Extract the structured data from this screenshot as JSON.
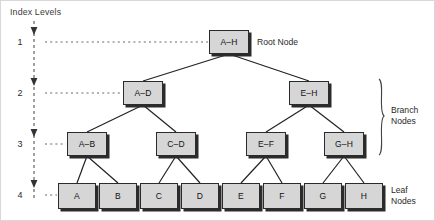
{
  "diagram": {
    "title": "Index Levels",
    "colors": {
      "node_fill": "#d6d6d6",
      "node_border": "#2b2b2b",
      "shadow": "#2b2b2b",
      "guide_line": "#555555",
      "connector": "#222222"
    },
    "levels": [
      {
        "number": "1",
        "y": 41
      },
      {
        "number": "2",
        "y": 92
      },
      {
        "number": "3",
        "y": 143
      },
      {
        "number": "4",
        "y": 194
      }
    ],
    "nodes": {
      "level1": [
        {
          "label": "A–H",
          "x": 208,
          "y": 29,
          "w": 40,
          "h": 24
        }
      ],
      "level2": [
        {
          "label": "A–D",
          "x": 122,
          "y": 80,
          "w": 40,
          "h": 24
        },
        {
          "label": "E–H",
          "x": 288,
          "y": 80,
          "w": 40,
          "h": 24
        }
      ],
      "level3": [
        {
          "label": "A–B",
          "x": 66,
          "y": 131,
          "w": 40,
          "h": 24
        },
        {
          "label": "C–D",
          "x": 155,
          "y": 131,
          "w": 40,
          "h": 24
        },
        {
          "label": "E–F",
          "x": 245,
          "y": 131,
          "w": 40,
          "h": 24
        },
        {
          "label": "G–H",
          "x": 323,
          "y": 131,
          "w": 40,
          "h": 24
        }
      ],
      "level4": [
        {
          "label": "A",
          "x": 57,
          "y": 182,
          "w": 38,
          "h": 26
        },
        {
          "label": "B",
          "x": 98,
          "y": 182,
          "w": 38,
          "h": 26
        },
        {
          "label": "C",
          "x": 139,
          "y": 182,
          "w": 38,
          "h": 26
        },
        {
          "label": "D",
          "x": 180,
          "y": 182,
          "w": 38,
          "h": 26
        },
        {
          "label": "E",
          "x": 221,
          "y": 182,
          "w": 38,
          "h": 26
        },
        {
          "label": "F",
          "x": 262,
          "y": 182,
          "w": 38,
          "h": 26
        },
        {
          "label": "G",
          "x": 303,
          "y": 182,
          "w": 38,
          "h": 26
        },
        {
          "label": "H",
          "x": 344,
          "y": 182,
          "w": 38,
          "h": 26
        }
      ]
    },
    "annotations": {
      "root_node": "Root Node",
      "branch_nodes_line1": "Branch",
      "branch_nodes_line2": "Nodes",
      "leaf_nodes_line1": "Leaf",
      "leaf_nodes_line2": "Nodes"
    }
  }
}
